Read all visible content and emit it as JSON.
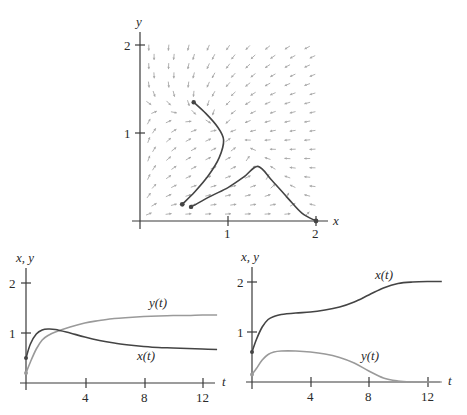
{
  "chart_data": [
    {
      "type": "line",
      "title": "Phase plane with direction field",
      "xlabel": "x",
      "ylabel": "y",
      "xlim": [
        0,
        2.1
      ],
      "ylim": [
        0,
        2.1
      ],
      "xticks": [
        1,
        2
      ],
      "yticks": [
        1,
        2
      ],
      "grid": false,
      "direction_field": true,
      "series": [
        {
          "name": "trajectory-1",
          "color": "#444444",
          "points": [
            [
              0.61,
              1.35
            ],
            [
              0.75,
              1.22
            ],
            [
              0.88,
              1.07
            ],
            [
              0.95,
              0.92
            ],
            [
              0.9,
              0.72
            ],
            [
              0.78,
              0.52
            ],
            [
              0.62,
              0.33
            ],
            [
              0.48,
              0.19
            ]
          ],
          "start_marker": true,
          "end_marker": true
        },
        {
          "name": "trajectory-2",
          "color": "#444444",
          "points": [
            [
              0.58,
              0.16
            ],
            [
              0.8,
              0.28
            ],
            [
              1.0,
              0.38
            ],
            [
              1.18,
              0.5
            ],
            [
              1.34,
              0.62
            ],
            [
              1.5,
              0.46
            ],
            [
              1.68,
              0.26
            ],
            [
              1.84,
              0.09
            ],
            [
              2.0,
              0.0
            ]
          ],
          "start_marker": true,
          "end_marker": true
        }
      ],
      "labels": {
        "x": "x",
        "y": "y",
        "tick_x": [
          "1",
          "2"
        ],
        "tick_y": [
          "1",
          "2"
        ]
      }
    },
    {
      "type": "line",
      "xlabel": "t",
      "ylabel": "x, y",
      "xlim": [
        0,
        13
      ],
      "ylim": [
        0,
        2.3
      ],
      "xticks": [
        4,
        8,
        12
      ],
      "yticks": [
        1,
        2
      ],
      "grid": false,
      "series": [
        {
          "name": "x(t)",
          "color": "#444444",
          "x": [
            0,
            0.3,
            0.7,
            1.1,
            1.5,
            2,
            3,
            4,
            5,
            6,
            7,
            8,
            9,
            10,
            11,
            12,
            13
          ],
          "values": [
            0.5,
            0.78,
            0.98,
            1.06,
            1.08,
            1.07,
            1.0,
            0.92,
            0.85,
            0.8,
            0.76,
            0.73,
            0.71,
            0.7,
            0.69,
            0.68,
            0.67
          ]
        },
        {
          "name": "y(t)",
          "color": "#9a9a9a",
          "x": [
            0,
            0.3,
            0.7,
            1.1,
            1.5,
            2,
            3,
            4,
            5,
            6,
            7,
            8,
            9,
            10,
            11,
            12,
            13
          ],
          "values": [
            0.2,
            0.42,
            0.68,
            0.86,
            0.95,
            1.02,
            1.12,
            1.2,
            1.25,
            1.29,
            1.31,
            1.33,
            1.34,
            1.35,
            1.35,
            1.36,
            1.36
          ]
        }
      ],
      "labels": {
        "x": "t",
        "y": "x, y",
        "tick_x": [
          "4",
          "8",
          "12"
        ],
        "tick_y": [
          "1",
          "2"
        ],
        "curve_x": "x(t)",
        "curve_y": "y(t)"
      }
    },
    {
      "type": "line",
      "xlabel": "t",
      "ylabel": "x, y",
      "xlim": [
        0,
        13
      ],
      "ylim": [
        0,
        2.3
      ],
      "xticks": [
        4,
        8,
        12
      ],
      "yticks": [
        1,
        2
      ],
      "grid": false,
      "series": [
        {
          "name": "x(t)",
          "color": "#444444",
          "x": [
            0,
            0.3,
            0.7,
            1.1,
            1.5,
            2,
            3,
            4,
            5,
            6,
            7,
            8,
            9,
            10,
            11,
            12,
            13
          ],
          "values": [
            0.6,
            0.85,
            1.1,
            1.25,
            1.31,
            1.35,
            1.38,
            1.4,
            1.44,
            1.5,
            1.6,
            1.74,
            1.88,
            1.97,
            2.0,
            2.01,
            2.01
          ]
        },
        {
          "name": "y(t)",
          "color": "#9a9a9a",
          "x": [
            0,
            0.3,
            0.7,
            1.1,
            1.5,
            2,
            3,
            4,
            5,
            6,
            7,
            8,
            9,
            10,
            11,
            12,
            13
          ],
          "values": [
            0.15,
            0.27,
            0.44,
            0.55,
            0.6,
            0.62,
            0.62,
            0.6,
            0.56,
            0.49,
            0.38,
            0.22,
            0.08,
            0.02,
            0.0,
            0.0,
            0.0
          ]
        }
      ],
      "labels": {
        "x": "t",
        "y": "x, y",
        "tick_x": [
          "4",
          "8",
          "12"
        ],
        "tick_y": [
          "1",
          "2"
        ],
        "curve_x": "x(t)",
        "curve_y": "y(t)"
      }
    }
  ],
  "styles": {
    "axis_color": "#3a3a3a",
    "field_color": "#a8a8a8",
    "x_curve_color": "#444444",
    "y_curve_color": "#9a9a9a"
  }
}
